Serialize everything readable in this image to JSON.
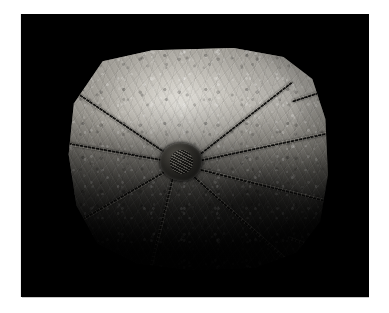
{
  "page": {
    "background_color": "#ffffff",
    "width": 389,
    "height": 313
  },
  "photo": {
    "name": "fossil-specimen-photograph",
    "background_color": "#000000",
    "subject": "fossil arachnid specimen on rock slab",
    "alt_text": "Black-and-white photograph of a fossilised long-legged arachnid preserved on a roughly octagonal stone slab, lit from the upper left",
    "frame": {
      "left": 21,
      "top": 14,
      "width": 348,
      "height": 283
    }
  },
  "specimen": {
    "name": "fossil-arachnid",
    "slab_shape": "octagonal-rounded",
    "body_label": "cephalothorax",
    "legs": [
      {
        "id": "leg-1",
        "label": "upper-right-leg",
        "angle": -38,
        "length": 46,
        "x": 50,
        "y": 48
      },
      {
        "id": "leg-1b",
        "label": "upper-right-leg-distal",
        "angle": -18,
        "length": 34
      },
      {
        "id": "leg-2",
        "label": "right-upper-leg",
        "angle": -12,
        "length": 58,
        "x": 51,
        "y": 50
      },
      {
        "id": "leg-2b",
        "label": "right-upper-leg-distal",
        "angle": 2,
        "length": 42
      },
      {
        "id": "leg-3",
        "label": "right-lower-leg",
        "angle": 14,
        "length": 60,
        "x": 51,
        "y": 54
      },
      {
        "id": "leg-3b",
        "label": "right-lower-leg-distal",
        "angle": 1,
        "length": 44
      },
      {
        "id": "leg-4",
        "label": "lower-right-leg",
        "angle": 42,
        "length": 48,
        "x": 49,
        "y": 57
      },
      {
        "id": "leg-4b",
        "label": "lower-right-leg-distal",
        "angle": 20,
        "length": 38
      },
      {
        "id": "leg-5",
        "label": "upper-left-leg",
        "angle": 214,
        "length": 44,
        "x": 38,
        "y": 47
      },
      {
        "id": "leg-5b",
        "label": "upper-left-leg-distal",
        "angle": 196,
        "length": 32
      },
      {
        "id": "leg-6",
        "label": "left-upper-leg",
        "angle": 190,
        "length": 40,
        "x": 37,
        "y": 50
      },
      {
        "id": "leg-6b",
        "label": "left-upper-leg-distal",
        "angle": 206,
        "length": 30
      },
      {
        "id": "leg-7",
        "label": "left-lower-leg",
        "angle": 150,
        "length": 44,
        "x": 38,
        "y": 55
      },
      {
        "id": "leg-7b",
        "label": "left-lower-leg-distal",
        "angle": 130,
        "length": 36
      },
      {
        "id": "leg-8",
        "label": "lower-left-leg",
        "angle": 104,
        "length": 50,
        "x": 41,
        "y": 58
      },
      {
        "id": "leg-8b",
        "label": "lower-left-leg-distal",
        "angle": 92,
        "length": 40
      }
    ],
    "lighting": "raking light from upper left",
    "tone_range": {
      "highlight": "#e8e6e0",
      "midtone": "#8c8983",
      "shadow": "#070707"
    }
  }
}
